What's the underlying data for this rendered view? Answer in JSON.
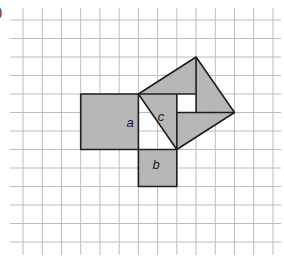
{
  "figure": {
    "part_label": ")",
    "grid": {
      "x0": 23,
      "dx": 19.23,
      "cols": 14,
      "y0": 20,
      "dy": 18.5,
      "rows": 13,
      "h_line_start_x": 10,
      "h_line_end_x": 281,
      "v_line_start_y": 8,
      "v_line_end_y": 255,
      "line_color": "#bdbdbd"
    },
    "colors": {
      "fill": "#b3b3b3",
      "outline": "#1e1e1e",
      "hole": "#ffffff"
    },
    "squares": {
      "a": {
        "label": "a",
        "grid_corners": [
          [
            3,
            4
          ],
          [
            6,
            4
          ],
          [
            6,
            7
          ],
          [
            3,
            7
          ]
        ],
        "label_pos": [
          130,
          122
        ]
      },
      "b": {
        "label": "b",
        "grid_corners": [
          [
            6,
            7
          ],
          [
            8,
            7
          ],
          [
            8,
            9
          ],
          [
            6,
            9
          ]
        ],
        "label_pos": [
          156,
          164
        ]
      },
      "c": {
        "label": "c",
        "grid_corners": [
          [
            6,
            4
          ],
          [
            9,
            2
          ],
          [
            11,
            5
          ],
          [
            8,
            7
          ]
        ],
        "label_pos": [
          161,
          116
        ]
      }
    },
    "c_inner_lines": [
      [
        [
          6,
          4
        ],
        [
          9,
          4
        ]
      ],
      [
        [
          9,
          2
        ],
        [
          9,
          5
        ]
      ],
      [
        [
          8,
          5
        ],
        [
          11,
          5
        ]
      ],
      [
        [
          8,
          4
        ],
        [
          8,
          7
        ]
      ]
    ],
    "c_hole": [
      [
        8,
        4
      ],
      [
        9,
        4
      ],
      [
        9,
        5
      ],
      [
        8,
        5
      ]
    ]
  }
}
